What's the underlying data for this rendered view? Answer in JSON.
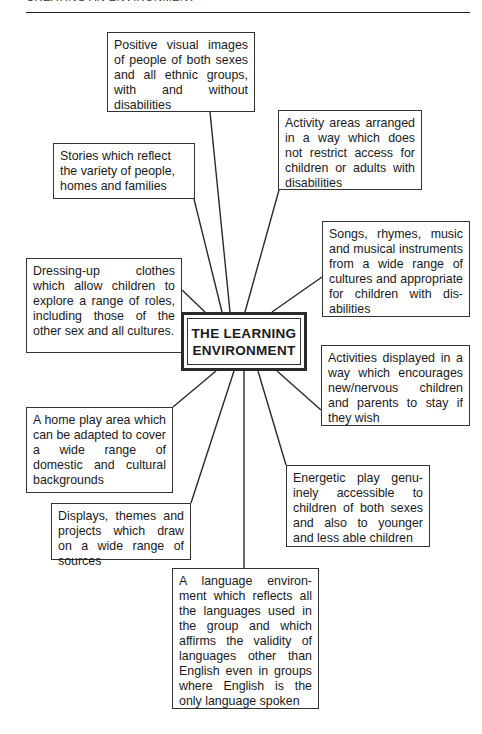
{
  "page": {
    "running_head": "CREATING AN ENVIRONMENT"
  },
  "diagram": {
    "center": {
      "line1": "THE LEARNING",
      "line2": "ENVIRONMENT"
    },
    "nodes": [
      {
        "id": "positive-images",
        "text": "Positive visual images of people of both sexes and all ethnic groups, with and without disabilities"
      },
      {
        "id": "activity-areas",
        "text": "Activity areas arranged in a way which does not restrict access for children or adults with disabilities"
      },
      {
        "id": "stories",
        "text": "Stories which reflect the variety of people, homes and families"
      },
      {
        "id": "songs",
        "text": "Songs, rhymes, music and musical instruments from a wide range of cultures and appropri­ate for children with dis­abilities"
      },
      {
        "id": "dressing-up",
        "text": "Dressing-up clothes which allow children to explore a range of roles, including those of the other sex and all cultures."
      },
      {
        "id": "activities-displayed",
        "text": "Activities displayed in a way which encourages new/nervous children and parents to stay if they wish"
      },
      {
        "id": "home-play",
        "text": "A home play area which can be adapted to cover a wide range of domestic and cultural backgrounds"
      },
      {
        "id": "energetic-play",
        "text": "Energetic play genu­inely accessible to children of both sexes and also to younger and less able children"
      },
      {
        "id": "displays",
        "text": "Displays, themes and projects which draw on a wide range of sources"
      },
      {
        "id": "language",
        "text": "A language environ­ment which reflects all the languages used in the group and which affirms the validity of languages other than English even in groups where English is the only language spoken"
      }
    ]
  }
}
